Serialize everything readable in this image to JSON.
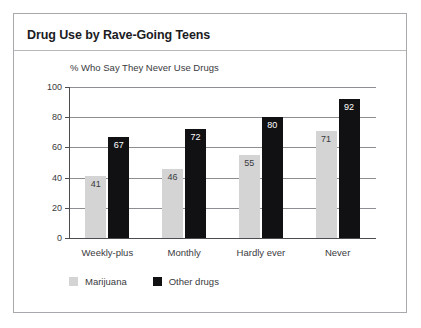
{
  "figure": {
    "title": "Drug Use by Rave-Going Teens"
  },
  "legend": {
    "items": [
      {
        "label": "Marijuana",
        "color": "#d4d4d4",
        "swatch": "legend-swatch-marijuana"
      },
      {
        "label": "Other drugs",
        "color": "#111114",
        "swatch": "legend-swatch-other-drugs"
      }
    ]
  },
  "chart_data": {
    "type": "bar",
    "title": "Drug Use by Rave-Going Teens",
    "subtitle": "% Who Say They Never Use Drugs",
    "xlabel": "",
    "ylabel": "",
    "ylim": [
      0,
      100
    ],
    "yticks": [
      0,
      20,
      40,
      60,
      80,
      100
    ],
    "ytick_labels": [
      "0",
      "20",
      "40",
      "60",
      "80",
      "100"
    ],
    "grid": true,
    "legend_position": "bottom-left",
    "categories": [
      "Weekly-plus",
      "Monthly",
      "Hardly ever",
      "Never"
    ],
    "series": [
      {
        "name": "Marijuana",
        "color": "#d4d4d4",
        "values": [
          41,
          46,
          55,
          71
        ],
        "labels": [
          "41",
          "46",
          "55",
          "71"
        ]
      },
      {
        "name": "Other drugs",
        "color": "#111114",
        "values": [
          67,
          72,
          80,
          92
        ],
        "labels": [
          "67",
          "72",
          "80",
          "92"
        ]
      }
    ]
  }
}
